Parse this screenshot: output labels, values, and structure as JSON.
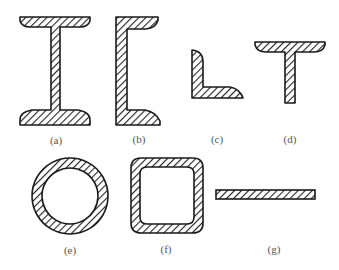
{
  "figure": {
    "hatch_color": "#222222",
    "outline_color": "#1a1a1a",
    "label_color": "#555555",
    "shapes": [
      {
        "id": "a",
        "label": "(a)",
        "name": "I-beam section"
      },
      {
        "id": "b",
        "label": "(b)",
        "name": "Channel section"
      },
      {
        "id": "c",
        "label": "(c)",
        "name": "Angle section"
      },
      {
        "id": "d",
        "label": "(d)",
        "name": "Tee section"
      },
      {
        "id": "e",
        "label": "(e)",
        "name": "Circular hollow tube"
      },
      {
        "id": "f",
        "label": "(f)",
        "name": "Square hollow tube"
      },
      {
        "id": "g",
        "label": "(g)",
        "name": "Flat plate"
      }
    ]
  }
}
